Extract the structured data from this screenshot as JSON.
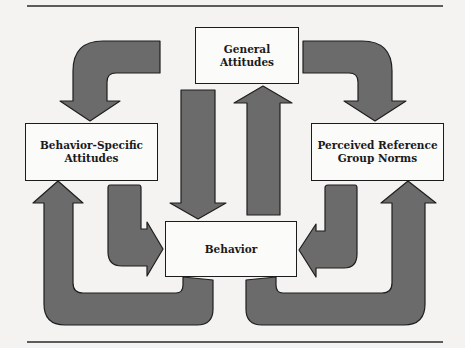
{
  "diagram": {
    "nodes": {
      "general_attitudes": {
        "label": "General\nAttitudes"
      },
      "behavior_specific_attitudes": {
        "label": "Behavior-Specific\nAttitudes"
      },
      "perceived_reference_group_norms": {
        "label": "Perceived Reference\nGroup  Norms"
      },
      "behavior": {
        "label": "Behavior"
      }
    },
    "edges": [
      {
        "from": "General Attitudes",
        "to": "Behavior-Specific Attitudes",
        "shape": "curved-arrow"
      },
      {
        "from": "General Attitudes",
        "to": "Perceived Reference Group Norms",
        "shape": "curved-arrow"
      },
      {
        "from": "General Attitudes",
        "to": "Behavior",
        "shape": "straight-arrow-down"
      },
      {
        "from": "Behavior",
        "to": "General Attitudes",
        "shape": "straight-arrow-up"
      },
      {
        "from": "Behavior-Specific Attitudes",
        "to": "Behavior",
        "shape": "L-arrow"
      },
      {
        "from": "Perceived Reference Group Norms",
        "to": "Behavior",
        "shape": "L-arrow"
      },
      {
        "from": "Behavior",
        "to": "Behavior-Specific Attitudes",
        "shape": "U-arrow"
      },
      {
        "from": "Behavior",
        "to": "Perceived Reference Group Norms",
        "shape": "U-arrow"
      }
    ],
    "colors": {
      "arrow_fill": "#6b6b6b",
      "arrow_stroke": "#1e1e1e",
      "box_fill": "#fbfbfa",
      "rule": "#2a2a2a",
      "background": "#f4f3f1"
    }
  }
}
